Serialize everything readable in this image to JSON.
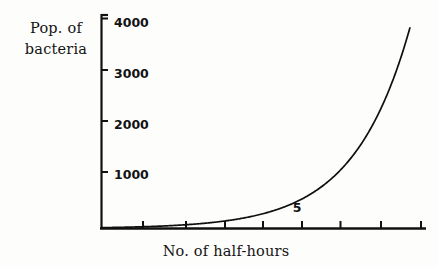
{
  "chart_data": {
    "type": "line",
    "title": "",
    "xlabel": "No. of half-hours",
    "ylabel_line1": "Pop. of",
    "ylabel_line2": "bacteria",
    "ylabel": "Pop. of bacteria",
    "ylim": [
      0,
      4300
    ],
    "xlim": [
      0,
      8.3
    ],
    "grid": false,
    "legend": null,
    "y_tick_labels": [
      "1000",
      "2000",
      "3000",
      "4000"
    ],
    "y_tick_values": [
      1000,
      2000,
      3000,
      4000
    ],
    "x_tick_labels": [
      "",
      "",
      "",
      "",
      "5",
      "",
      ""
    ],
    "x_tick_values": [
      1,
      2,
      3,
      4,
      5,
      6,
      7
    ],
    "x_labeled_tick": "5",
    "series": [
      {
        "name": "Population of bacteria",
        "x": [
          0,
          0.5,
          1,
          1.5,
          2,
          2.5,
          3,
          3.5,
          4,
          4.5,
          5,
          5.5,
          6,
          6.5,
          7
        ],
        "values": [
          16,
          23,
          32,
          45,
          64,
          90,
          128,
          181,
          256,
          362,
          512,
          724,
          1024,
          1448,
          2048
        ]
      }
    ],
    "curve_color": "#0f0f0f",
    "axis_color": "#111111",
    "background_color": "#fdfdfc"
  }
}
